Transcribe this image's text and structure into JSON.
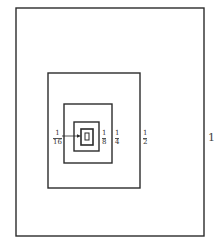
{
  "diagram": {
    "rects": [
      {
        "label": "1",
        "x": 16,
        "y": 8,
        "w": 188,
        "h": 228
      },
      {
        "label": "1/2",
        "x": 48,
        "y": 73,
        "w": 92,
        "h": 115
      },
      {
        "label": "1/4",
        "x": 64,
        "y": 104,
        "w": 48,
        "h": 59
      },
      {
        "label": "1/8",
        "x": 74,
        "y": 122,
        "w": 25,
        "h": 29
      },
      {
        "label": "1/16",
        "x": 81,
        "y": 129,
        "w": 12,
        "h": 16
      },
      {
        "label": "1/32",
        "x": 84,
        "y": 133,
        "w": 5,
        "h": 8
      }
    ],
    "labels": {
      "one": "1",
      "half_num": "1",
      "half_den": "2",
      "quarter_num": "1",
      "quarter_den": "4",
      "eighth_num": "1",
      "eighth_den": "8",
      "sixteenth_num": "1",
      "sixteenth_den": "16"
    },
    "stroke_color": "#2b2b2b"
  }
}
